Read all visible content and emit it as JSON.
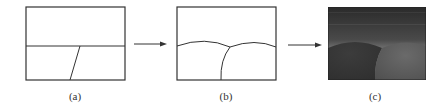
{
  "figure": {
    "panels": [
      {
        "id": "a",
        "label": "(a)",
        "description": "rectangle with horizontal line and slanted dividing line"
      },
      {
        "id": "b",
        "label": "(b)",
        "description": "rectangle with two curved arcs meeting at a junction and a curved vertical line"
      },
      {
        "id": "c",
        "label": "(c)",
        "description": "shaded rendering with dark gradient background and two domes"
      }
    ],
    "arrows": [
      {
        "from": "a",
        "to": "b",
        "icon": "right-arrow-icon"
      },
      {
        "from": "b",
        "to": "c",
        "icon": "right-arrow-icon"
      }
    ],
    "colors": {
      "line": "#333333",
      "background": "#ffffff",
      "shade_top": "#2a2a2a",
      "shade_mid": "#7a7a7a",
      "dome_left": "#363636",
      "dome_right": "#5e5e5e"
    }
  }
}
